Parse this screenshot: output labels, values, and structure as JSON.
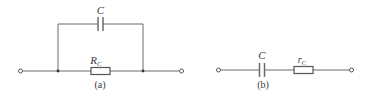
{
  "figure_a": {
    "caption": "(a)",
    "capacitor_label": "C",
    "resistor_label_main": "R",
    "resistor_label_sub": "C",
    "topology": "capacitor in parallel with resistor"
  },
  "figure_b": {
    "caption": "(b)",
    "capacitor_label": "C",
    "resistor_label_main": "r",
    "resistor_label_sub": "C",
    "topology": "capacitor in series with resistor"
  },
  "colors": {
    "wire": "#6a6a6a",
    "text": "#3a3a3a",
    "background": "#ffffff"
  }
}
